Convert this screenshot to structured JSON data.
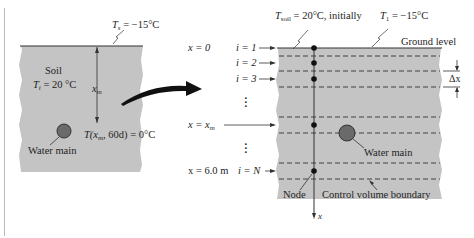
{
  "left_panel": {
    "surface_temp_symbol": "T",
    "surface_temp_sub": "s",
    "surface_temp_value": " = −15°C",
    "soil_label": "Soil",
    "initial_temp_symbol": "T",
    "initial_temp_sub": "i",
    "initial_temp_value": " = 20 °C",
    "depth_symbol": "x",
    "depth_sub": "m",
    "condition_prefix": "T(x",
    "condition_sub": "m",
    "condition_suffix": ", 60d) = 0°C",
    "water_main_label": "Water main"
  },
  "right_panel": {
    "tsoil_symbol": "T",
    "tsoil_sub": "soil",
    "tsoil_value": " = 20°C, initially",
    "t1_symbol": "T",
    "t1_sub": "1",
    "t1_value": " = −15°C",
    "ground_level_label": "Ground level",
    "delta_x_label": "Δx",
    "x_labels": {
      "x0": "x = 0",
      "xm_prefix": "x = x",
      "xm_sub": "m",
      "x6": "x = 6.0 m"
    },
    "node_labels": [
      "i = 1",
      "i = 2",
      "i = 3",
      "i = N"
    ],
    "water_main_label": "Water main",
    "node_label": "Node",
    "control_volume_label": "Control volume boundary",
    "axis_label": "x"
  },
  "colors": {
    "soil": "#c4c4c4",
    "line": "#333333",
    "pipe_fill": "#6a6a6a",
    "arrow": "#111111"
  }
}
